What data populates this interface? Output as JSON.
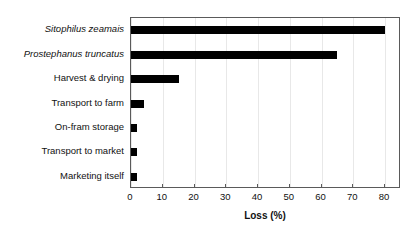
{
  "chart_data": {
    "type": "bar",
    "orientation": "horizontal",
    "title": "",
    "xlabel": "Loss (%)",
    "ylabel": "",
    "xlim": [
      0,
      85
    ],
    "xticks": [
      0,
      10,
      20,
      30,
      40,
      50,
      60,
      70,
      80
    ],
    "grid": true,
    "legend": false,
    "bar_color": "#000000",
    "categories": [
      "Sitophilus zeamais",
      "Prostephanus truncatus",
      "Harvest & drying",
      "Transport to farm",
      "On-fram storage",
      "Transport to market",
      "Marketing itself"
    ],
    "category_styles": [
      "italic",
      "italic",
      "normal",
      "normal",
      "normal",
      "normal",
      "normal"
    ],
    "values": [
      80,
      65,
      15,
      4,
      2,
      2,
      2
    ]
  }
}
